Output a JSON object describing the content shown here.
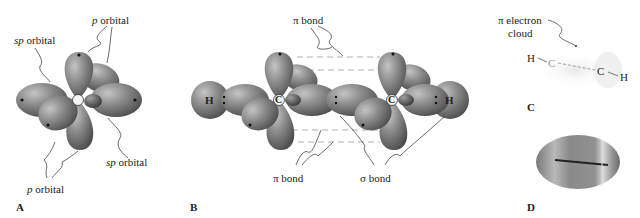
{
  "panels": [
    {
      "id": "A",
      "letter": "A",
      "labels": {
        "p_top_prefix": "p",
        "p_top_suffix": " orbital",
        "sp_left_prefix": "sp",
        "sp_left_suffix": " orbital",
        "sp_right_prefix": "sp",
        "sp_right_suffix": " orbital",
        "p_bottom_prefix": "p",
        "p_bottom_suffix": " orbital"
      },
      "atom": "C"
    },
    {
      "id": "B",
      "letter": "B",
      "labels": {
        "pi_top": "π bond",
        "pi_bottom": "π bond",
        "sigma": "σ bond"
      },
      "atoms": [
        "H",
        "C",
        "C",
        "H"
      ]
    },
    {
      "id": "C",
      "letter": "C",
      "labels": {
        "pi_cloud_line1": "π electron",
        "pi_cloud_line2": "cloud"
      },
      "atoms": [
        "H",
        "C",
        "C",
        "H"
      ]
    },
    {
      "id": "D",
      "letter": "D"
    }
  ],
  "colors": {
    "lobe_dark": "#5a5a5a",
    "lobe_mid": "#8a8a8a",
    "lobe_light": "#b0b0b0",
    "text": "#222222",
    "dash": "#9a9a9a"
  }
}
